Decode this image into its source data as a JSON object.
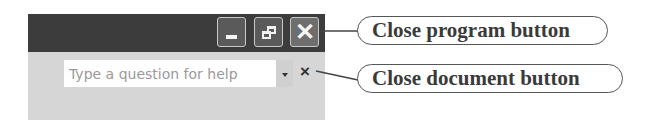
{
  "window_controls": {
    "minimize": {
      "icon": "minimize-icon"
    },
    "restore": {
      "icon": "restore-icon"
    },
    "close": {
      "icon": "close-icon",
      "glyph": "✕"
    }
  },
  "help_box": {
    "placeholder": "Type a question for help",
    "dropdown_icon": "chevron-down-icon"
  },
  "close_document": {
    "glyph": "×",
    "icon": "close-icon"
  },
  "callouts": [
    {
      "label": "Close program button"
    },
    {
      "label": "Close document button"
    }
  ],
  "colors": {
    "titlebar": "#3c3c3c",
    "toolbar": "#d6d6d6",
    "callout_text": "#3a3a3a"
  }
}
